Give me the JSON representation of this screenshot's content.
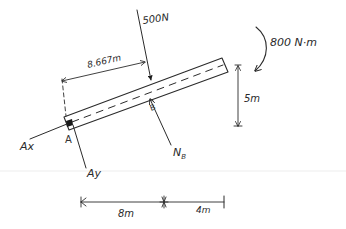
{
  "diagram": {
    "type": "free-body-diagram",
    "beam": {
      "description": "inclined beam with dashed centerline",
      "end_left": "A",
      "support_point": "B"
    },
    "loads": {
      "point_load": {
        "label": "500N",
        "value": 500,
        "unit": "N"
      },
      "moment": {
        "label": "800 N·m",
        "value": 800,
        "unit": "N·m",
        "direction": "clockwise"
      }
    },
    "reactions": {
      "ax": {
        "label": "Ax"
      },
      "ay": {
        "label": "Ay"
      },
      "nb": {
        "label": "N",
        "subscript": "B"
      }
    },
    "points": {
      "a": {
        "label": "A"
      },
      "b": {
        "label": "B"
      }
    },
    "dimensions": {
      "load_distance": {
        "label": "8.667m",
        "value": 8.667,
        "unit": "m"
      },
      "height": {
        "label": "5m",
        "value": 5,
        "unit": "m"
      },
      "horizontal_ab": {
        "label": "8m",
        "value": 8,
        "unit": "m"
      },
      "horizontal_b_end": {
        "label": "4m",
        "value": 4,
        "unit": "m"
      }
    }
  }
}
